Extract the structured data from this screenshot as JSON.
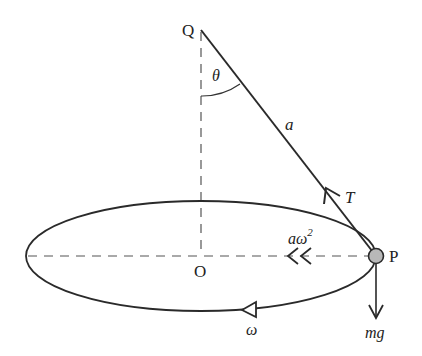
{
  "diagram": {
    "labels": {
      "pivot": "Q",
      "centre": "O",
      "particle": "P",
      "angle": "θ",
      "string_length": "a",
      "tension": "T",
      "centripetal": "aω",
      "centripetal_exp": "2",
      "weight": "mg",
      "angular_velocity": "ω"
    },
    "colors": {
      "line": "#2a2a2a",
      "dashed": "#555555",
      "particle_fill": "#b8b8b8"
    }
  }
}
